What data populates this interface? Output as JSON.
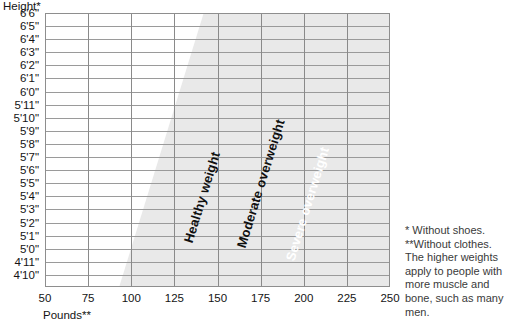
{
  "axes": {
    "y_title": "Height*",
    "x_title": "Pounds**"
  },
  "notes": {
    "line1": "* Without shoes.",
    "line2": "**Without clothes.",
    "line3": "The higher weights",
    "line4": "apply to people with",
    "line5": "more muscle and",
    "line6": "bone, such as many",
    "line7": "men."
  },
  "colors": {
    "underweight": "#ffffff",
    "healthy": "#e9e9e9",
    "moderate": "#cbcbcb",
    "severe": "#a9a9a9",
    "gridline": "#9a9a9a",
    "border": "#8e8e8e",
    "text": "#141414",
    "label_light": "#ffffff"
  },
  "chart_data": {
    "type": "area",
    "title": "",
    "xlabel": "Pounds**",
    "ylabel": "Height*",
    "grid": true,
    "legend": "inline-diagonal-labels",
    "xlim": [
      50,
      250
    ],
    "x_ticks": [
      50,
      75,
      100,
      125,
      150,
      175,
      200,
      225,
      250
    ],
    "y_ticks": [
      "6'6\"",
      "6'5\"",
      "6'4\"",
      "6'3\"",
      "6'2\"",
      "6'1\"",
      "6'0\"",
      "5'11\"",
      "5'10\"",
      "5'9\"",
      "5'8\"",
      "5'7\"",
      "5'6\"",
      "5'5\"",
      "5'4\"",
      "5'3\"",
      "5'2\"",
      "5'1\"",
      "5'0\"",
      "4'11\"",
      "4'10\""
    ],
    "ylim_top": "6'6\"",
    "ylim_bottom": "4'10\"",
    "bands": [
      {
        "name": "healthy-weight",
        "label": "Healthy weight",
        "fill": "#e9e9e9",
        "label_color": "#101010",
        "boundary_pounds_at_bottom": 93,
        "boundary_pounds_at_top": 142
      },
      {
        "name": "moderate-overweight",
        "label": "Moderate overweight",
        "fill": "#cbcbcb",
        "label_color": "#101010",
        "boundary_pounds_at_bottom": 117,
        "boundary_pounds_at_top": 188
      },
      {
        "name": "severe-overweight",
        "label": "Severe overweight",
        "fill": "#a9a9a9",
        "label_color": "#ffffff",
        "boundary_pounds_at_bottom": 140,
        "boundary_pounds_at_top": 218
      }
    ]
  }
}
